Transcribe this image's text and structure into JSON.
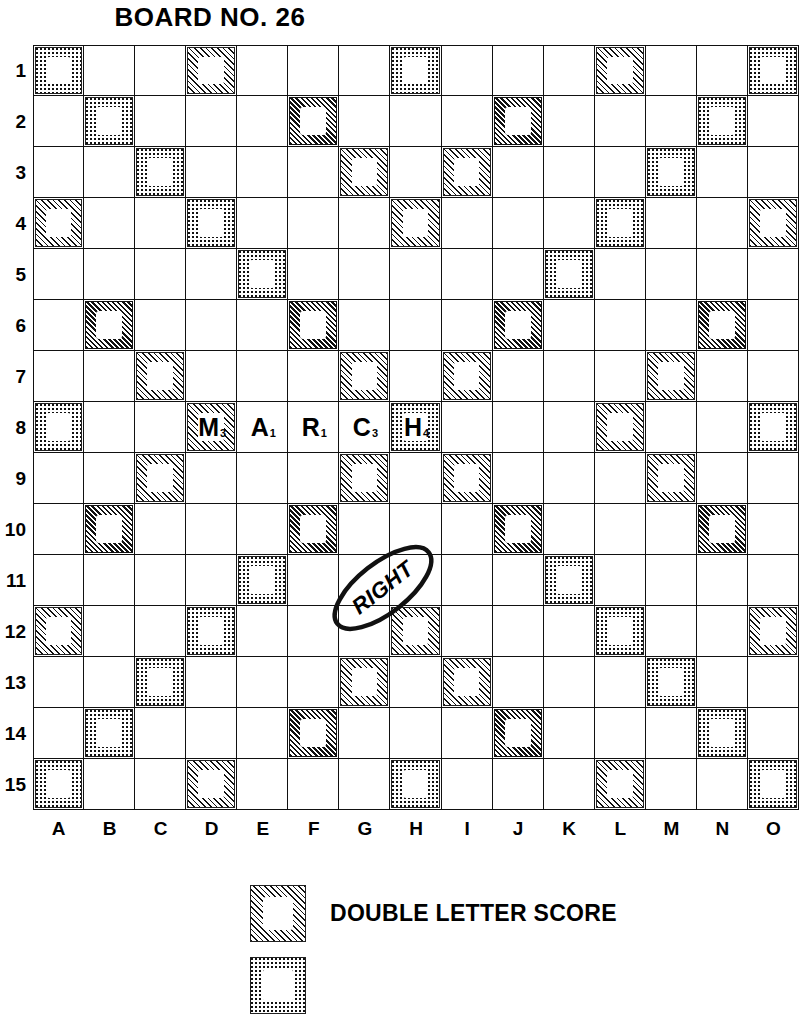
{
  "title": "BOARD NO. 26",
  "board": {
    "columns": [
      "A",
      "B",
      "C",
      "D",
      "E",
      "F",
      "G",
      "H",
      "I",
      "J",
      "K",
      "L",
      "M",
      "N",
      "O"
    ],
    "rows": [
      "1",
      "2",
      "3",
      "4",
      "5",
      "6",
      "7",
      "8",
      "9",
      "10",
      "11",
      "12",
      "13",
      "14",
      "15"
    ],
    "size": 15,
    "premium_legend_types": {
      "dot": "fine-dot screen square",
      "hatch": "diagonal hatch square",
      "dark": "dense dark diagonal hatch square"
    },
    "premium_squares": [
      {
        "row": 1,
        "col": "A",
        "type": "dot"
      },
      {
        "row": 1,
        "col": "D",
        "type": "hatch"
      },
      {
        "row": 1,
        "col": "H",
        "type": "dot"
      },
      {
        "row": 1,
        "col": "L",
        "type": "hatch"
      },
      {
        "row": 1,
        "col": "O",
        "type": "dot"
      },
      {
        "row": 2,
        "col": "B",
        "type": "dot"
      },
      {
        "row": 2,
        "col": "F",
        "type": "dark"
      },
      {
        "row": 2,
        "col": "J",
        "type": "dark"
      },
      {
        "row": 2,
        "col": "N",
        "type": "dot"
      },
      {
        "row": 3,
        "col": "C",
        "type": "dot"
      },
      {
        "row": 3,
        "col": "G",
        "type": "hatch"
      },
      {
        "row": 3,
        "col": "I",
        "type": "hatch"
      },
      {
        "row": 3,
        "col": "M",
        "type": "dot"
      },
      {
        "row": 4,
        "col": "A",
        "type": "hatch"
      },
      {
        "row": 4,
        "col": "D",
        "type": "dot"
      },
      {
        "row": 4,
        "col": "H",
        "type": "hatch"
      },
      {
        "row": 4,
        "col": "L",
        "type": "dot"
      },
      {
        "row": 4,
        "col": "O",
        "type": "hatch"
      },
      {
        "row": 5,
        "col": "E",
        "type": "dot"
      },
      {
        "row": 5,
        "col": "K",
        "type": "dot"
      },
      {
        "row": 6,
        "col": "B",
        "type": "dark"
      },
      {
        "row": 6,
        "col": "F",
        "type": "dark"
      },
      {
        "row": 6,
        "col": "J",
        "type": "dark"
      },
      {
        "row": 6,
        "col": "N",
        "type": "dark"
      },
      {
        "row": 7,
        "col": "C",
        "type": "hatch"
      },
      {
        "row": 7,
        "col": "G",
        "type": "hatch"
      },
      {
        "row": 7,
        "col": "I",
        "type": "hatch"
      },
      {
        "row": 7,
        "col": "M",
        "type": "hatch"
      },
      {
        "row": 8,
        "col": "A",
        "type": "dot"
      },
      {
        "row": 8,
        "col": "D",
        "type": "hatch"
      },
      {
        "row": 8,
        "col": "H",
        "type": "dot"
      },
      {
        "row": 8,
        "col": "L",
        "type": "hatch"
      },
      {
        "row": 8,
        "col": "O",
        "type": "dot"
      },
      {
        "row": 9,
        "col": "C",
        "type": "hatch"
      },
      {
        "row": 9,
        "col": "G",
        "type": "hatch"
      },
      {
        "row": 9,
        "col": "I",
        "type": "hatch"
      },
      {
        "row": 9,
        "col": "M",
        "type": "hatch"
      },
      {
        "row": 10,
        "col": "B",
        "type": "dark"
      },
      {
        "row": 10,
        "col": "F",
        "type": "dark"
      },
      {
        "row": 10,
        "col": "J",
        "type": "dark"
      },
      {
        "row": 10,
        "col": "N",
        "type": "dark"
      },
      {
        "row": 11,
        "col": "E",
        "type": "dot"
      },
      {
        "row": 11,
        "col": "K",
        "type": "dot"
      },
      {
        "row": 12,
        "col": "A",
        "type": "hatch"
      },
      {
        "row": 12,
        "col": "D",
        "type": "dot"
      },
      {
        "row": 12,
        "col": "H",
        "type": "hatch"
      },
      {
        "row": 12,
        "col": "L",
        "type": "dot"
      },
      {
        "row": 12,
        "col": "O",
        "type": "hatch"
      },
      {
        "row": 13,
        "col": "C",
        "type": "dot"
      },
      {
        "row": 13,
        "col": "G",
        "type": "hatch"
      },
      {
        "row": 13,
        "col": "I",
        "type": "hatch"
      },
      {
        "row": 13,
        "col": "M",
        "type": "dot"
      },
      {
        "row": 14,
        "col": "B",
        "type": "dot"
      },
      {
        "row": 14,
        "col": "F",
        "type": "dark"
      },
      {
        "row": 14,
        "col": "J",
        "type": "dark"
      },
      {
        "row": 14,
        "col": "N",
        "type": "dot"
      },
      {
        "row": 15,
        "col": "A",
        "type": "dot"
      },
      {
        "row": 15,
        "col": "D",
        "type": "hatch"
      },
      {
        "row": 15,
        "col": "H",
        "type": "dot"
      },
      {
        "row": 15,
        "col": "L",
        "type": "hatch"
      },
      {
        "row": 15,
        "col": "O",
        "type": "dot"
      }
    ],
    "tiles": [
      {
        "row": 8,
        "col": "D",
        "letter": "M",
        "points": "3"
      },
      {
        "row": 8,
        "col": "E",
        "letter": "A",
        "points": "1"
      },
      {
        "row": 8,
        "col": "F",
        "letter": "R",
        "points": "1"
      },
      {
        "row": 8,
        "col": "G",
        "letter": "C",
        "points": "3"
      },
      {
        "row": 8,
        "col": "H",
        "letter": "H",
        "points": "4"
      }
    ],
    "word_on_board": "MARCH"
  },
  "annotation": {
    "text": "RIGHT",
    "shape": "hand-drawn-ellipse",
    "near_cells": "F10-G11"
  },
  "legend": {
    "items": [
      {
        "label": "DOUBLE LETTER SCORE",
        "swatch": "hatch"
      },
      {
        "label": "",
        "swatch": "dot"
      }
    ]
  },
  "colors": {
    "ink": "#111111",
    "paper": "#ffffff"
  }
}
